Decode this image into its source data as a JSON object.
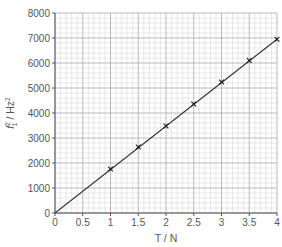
{
  "chart_data": {
    "type": "scatter",
    "title": "",
    "xlabel": "T / N",
    "ylabel_parts": {
      "base": "f",
      "sub": "1",
      "sup": "2",
      "unit": " / Hz",
      "unit_sup": "2"
    },
    "ylabel": "f1^2 / Hz^2",
    "xlim": [
      0,
      4
    ],
    "ylim": [
      0,
      8000
    ],
    "x_ticks": [
      0,
      0.5,
      1,
      1.5,
      2,
      2.5,
      3,
      3.5,
      4
    ],
    "x_tick_labels": [
      "0",
      "0.5",
      "1",
      "1.5",
      "2",
      "2.5",
      "3",
      "3.5",
      "4"
    ],
    "y_ticks": [
      0,
      1000,
      2000,
      3000,
      4000,
      5000,
      6000,
      7000,
      8000
    ],
    "y_tick_labels": [
      "0",
      "1000",
      "2000",
      "3000",
      "4000",
      "5000",
      "6000",
      "7000",
      "8000"
    ],
    "grid": true,
    "minor_divisions": 5,
    "marker": "x",
    "series": [
      {
        "name": "data",
        "x": [
          1,
          1.5,
          2,
          2.5,
          3,
          3.5,
          4
        ],
        "y": [
          1760,
          2640,
          3480,
          4360,
          5240,
          6100,
          6950
        ]
      }
    ],
    "best_fit_line": {
      "from": [
        0,
        0
      ],
      "to": [
        4,
        6950
      ]
    }
  }
}
